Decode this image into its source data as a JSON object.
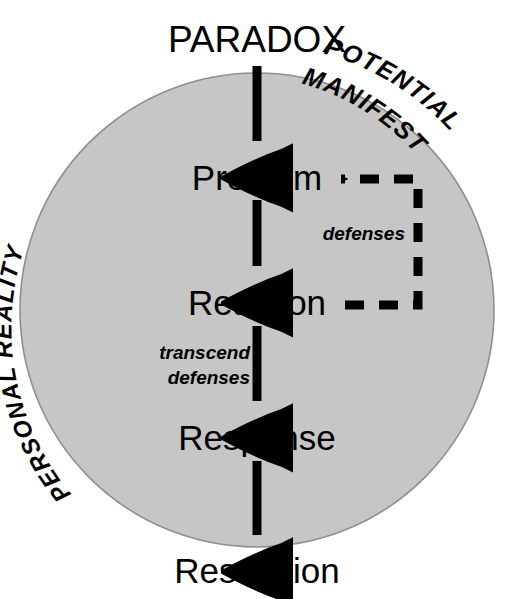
{
  "diagram": {
    "title": "PARADOX",
    "circle": {
      "fill_color": "#c6c6c6",
      "stroke_color": "#8a8a8a",
      "center_x": 257,
      "center_y": 310,
      "radius": 237
    },
    "arc_labels": [
      {
        "id": "potential",
        "text": "POTENTIAL"
      },
      {
        "id": "manifest",
        "text": "MANIFEST"
      },
      {
        "id": "personal-reality",
        "text": "PERSONAL REALITY"
      }
    ],
    "stages": [
      {
        "id": "paradox",
        "label": "PARADOX",
        "x": 257,
        "y": 52,
        "size": 37,
        "inside_circle": false
      },
      {
        "id": "problem",
        "label": "Problem",
        "x": 257,
        "y": 190,
        "size": 35,
        "inside_circle": true
      },
      {
        "id": "reaction",
        "label": "Reaction",
        "x": 257,
        "y": 315,
        "size": 35,
        "inside_circle": true
      },
      {
        "id": "response",
        "label": "Response",
        "x": 257,
        "y": 450,
        "size": 35,
        "inside_circle": true
      },
      {
        "id": "resolution",
        "label": "Resolution",
        "x": 257,
        "y": 583,
        "size": 35,
        "inside_circle": false
      }
    ],
    "annotations": [
      {
        "id": "defenses",
        "text": "defenses",
        "x": 405,
        "y": 240,
        "anchor": "end",
        "size": 19
      },
      {
        "id": "transcend",
        "text": "transcend",
        "x": 250,
        "y": 359,
        "anchor": "end",
        "size": 19
      },
      {
        "id": "transcend-defenses",
        "text": "defenses",
        "x": 250,
        "y": 384,
        "anchor": "end",
        "size": 19
      }
    ],
    "flow_arrows": [
      {
        "id": "paradox-to-problem",
        "from": "PARADOX",
        "to": "Problem",
        "x": 257,
        "y1": 66,
        "y2": 162
      },
      {
        "id": "problem-to-reaction",
        "from": "Problem",
        "to": "Reaction",
        "x": 257,
        "y1": 200,
        "y2": 287
      },
      {
        "id": "reaction-to-response",
        "from": "Reaction",
        "to": "Response",
        "x": 257,
        "y1": 326,
        "y2": 422
      },
      {
        "id": "response-to-resolution",
        "from": "Response",
        "to": "Resolution",
        "x": 257,
        "y1": 461,
        "y2": 556
      }
    ],
    "feedback_loop": {
      "id": "defenses-feedback",
      "from": "Reaction",
      "to": "Problem",
      "label": "defenses",
      "style": "dashed",
      "dash_color": "#000000",
      "points": {
        "start_x": 345,
        "start_y": 305,
        "corner_x": 418,
        "top_y": 179,
        "arrow_x": 333
      }
    }
  }
}
